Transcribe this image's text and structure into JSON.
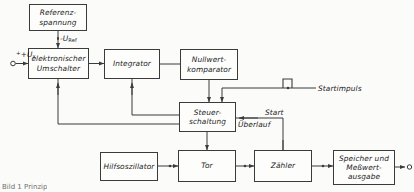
{
  "diagram": {
    "caption": "Bild 1 Prinzip",
    "blocks": [
      {
        "id": "referenzspannung",
        "label": "Referenz-\nspannung",
        "x": 29,
        "y": 4,
        "w": 58,
        "h": 27
      },
      {
        "id": "umschalter",
        "label": "elektronischer\nUmschalter",
        "x": 28,
        "y": 48,
        "w": 61,
        "h": 31
      },
      {
        "id": "integrator",
        "label": "Integrator",
        "x": 104,
        "y": 49,
        "w": 56,
        "h": 30
      },
      {
        "id": "nullwertkomparator",
        "label": "Nullwert-\nkomparator",
        "x": 180,
        "y": 49,
        "w": 58,
        "h": 31
      },
      {
        "id": "steuerschaltung",
        "label": "Steuer-\nschaltung",
        "x": 179,
        "y": 102,
        "w": 57,
        "h": 30
      },
      {
        "id": "hilfsoszillator",
        "label": "Hilfsoszillator",
        "x": 100,
        "y": 152,
        "w": 58,
        "h": 29
      },
      {
        "id": "tor",
        "label": "Tor",
        "x": 178,
        "y": 150,
        "w": 58,
        "h": 32
      },
      {
        "id": "zaehler",
        "label": "Zähler",
        "x": 254,
        "y": 150,
        "w": 58,
        "h": 32
      },
      {
        "id": "ausgabe",
        "label": "Speicher und\nMeßwert-\nausgabe",
        "x": 333,
        "y": 150,
        "w": 62,
        "h": 35
      }
    ],
    "labels": [
      {
        "id": "input-ux",
        "text": "+U",
        "sub": "x",
        "x": 16,
        "y": 50
      },
      {
        "id": "u-ref",
        "text": "-U",
        "sub": "Ref",
        "x": 60,
        "y": 36
      },
      {
        "id": "startimpuls",
        "text": "Startimpuls",
        "x": 318,
        "y": 85
      },
      {
        "id": "start",
        "text": "Start",
        "x": 265,
        "y": 110
      },
      {
        "id": "ueberlauf",
        "text": "Überlauf",
        "x": 238,
        "y": 121
      }
    ],
    "icons": [
      {
        "id": "pulse-waveform",
        "name": "pulse-waveform-icon",
        "x": 283,
        "y": 79
      },
      {
        "id": "input-terminal",
        "name": "input-terminal-icon",
        "x": 11,
        "y": 63
      },
      {
        "id": "output-terminal",
        "name": "output-terminal-icon",
        "x": 409,
        "y": 167
      }
    ],
    "colors": {
      "line": "#3b3b3b",
      "box_fill": "#fdfdfc",
      "text": "#1c1c1c",
      "background": "#fbfbfa",
      "caption": "#6e6e6e"
    }
  }
}
